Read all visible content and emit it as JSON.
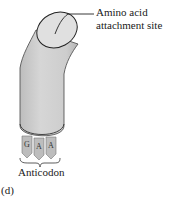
{
  "figure": {
    "panel_label": "(d)",
    "callout": {
      "line1": "Amino acid",
      "line2": "attachment site",
      "full": "Amino acid attachment site"
    },
    "anticodon": {
      "label": "Anticodon",
      "bases": [
        "G",
        "A",
        "A"
      ]
    },
    "colors": {
      "body_fill": "#cfcfcf",
      "body_shadow": "#b8b8b8",
      "top_fill": "#e2e2e2",
      "tab_fill": "#bdbdbd",
      "outline": "#222222",
      "text": "#1a1a1a"
    }
  }
}
